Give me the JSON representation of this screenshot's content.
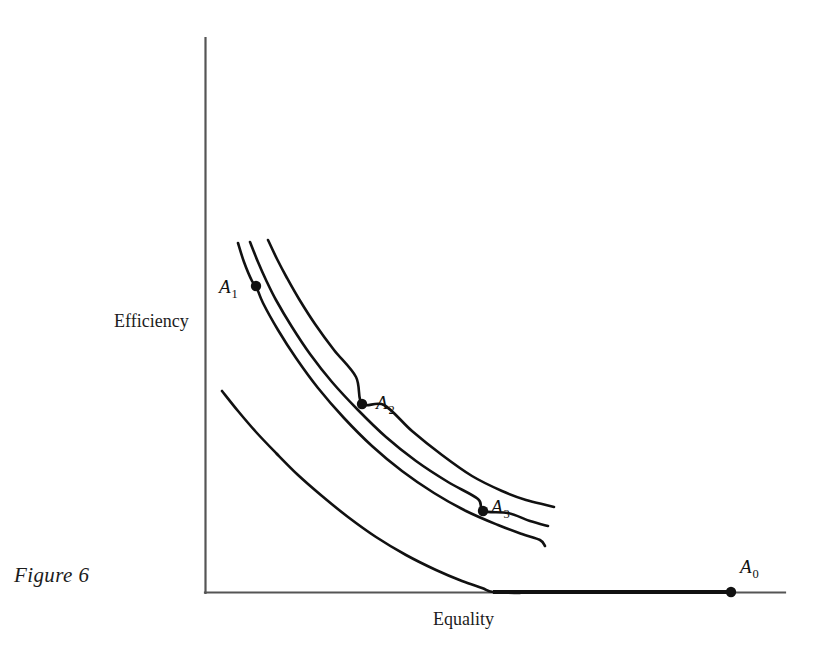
{
  "figure": {
    "caption": "Figure 6",
    "axes": {
      "y_label": "Efficiency",
      "x_label": "Equality"
    },
    "point_labels": {
      "a0": "A",
      "a0_sub": "0",
      "a1": "A",
      "a1_sub": "1",
      "a2": "A",
      "a2_sub": "2",
      "a3": "A",
      "a3_sub": "3"
    },
    "colors": {
      "ink": "#1a1a1a",
      "axis": "#555555",
      "curve": "#111111",
      "background": "#ffffff"
    }
  },
  "chart_data": {
    "type": "line",
    "title": "Figure 6",
    "xlabel": "Equality",
    "ylabel": "Efficiency",
    "grid": false,
    "legend": null,
    "axis_ticks": {
      "x": [],
      "y": []
    },
    "axis_pixel_frame": {
      "origin": [
        205,
        593
      ],
      "y_axis_top": [
        205,
        38
      ],
      "x_axis_right": [
        785,
        593
      ]
    },
    "series": [
      {
        "name": "Indifference curve I1",
        "role": "indifference-curve",
        "points": [
          [
            238,
            243
          ],
          [
            244,
            262
          ],
          [
            252,
            281
          ],
          [
            256,
            286
          ],
          [
            263,
            303
          ],
          [
            278,
            330
          ],
          [
            296,
            358
          ],
          [
            318,
            388
          ],
          [
            344,
            418
          ],
          [
            372,
            446
          ],
          [
            402,
            471
          ],
          [
            434,
            493
          ],
          [
            466,
            511
          ],
          [
            498,
            525
          ],
          [
            522,
            534
          ],
          [
            540,
            540
          ],
          [
            545,
            546
          ]
        ]
      },
      {
        "name": "Indifference curve I2",
        "role": "indifference-curve",
        "points": [
          [
            250,
            242
          ],
          [
            258,
            262
          ],
          [
            266,
            280
          ],
          [
            276,
            300
          ],
          [
            292,
            327
          ],
          [
            310,
            354
          ],
          [
            332,
            382
          ],
          [
            358,
            410
          ],
          [
            386,
            437
          ],
          [
            416,
            461
          ],
          [
            448,
            482
          ],
          [
            478,
            499
          ],
          [
            483,
            511
          ],
          [
            508,
            513
          ],
          [
            530,
            521
          ],
          [
            548,
            526
          ]
        ]
      },
      {
        "name": "Indifference curve I3",
        "role": "indifference-curve",
        "points": [
          [
            268,
            240
          ],
          [
            277,
            259
          ],
          [
            287,
            278
          ],
          [
            299,
            299
          ],
          [
            315,
            324
          ],
          [
            334,
            350
          ],
          [
            356,
            377
          ],
          [
            362,
            404
          ],
          [
            384,
            405
          ],
          [
            412,
            431
          ],
          [
            442,
            455
          ],
          [
            472,
            476
          ],
          [
            502,
            491
          ],
          [
            526,
            500
          ],
          [
            546,
            505
          ],
          [
            554,
            507
          ]
        ]
      },
      {
        "name": "Production possibility frontier",
        "role": "frontier",
        "points": [
          [
            222,
            391
          ],
          [
            238,
            411
          ],
          [
            256,
            432
          ],
          [
            276,
            453
          ],
          [
            298,
            475
          ],
          [
            322,
            496
          ],
          [
            348,
            517
          ],
          [
            376,
            537
          ],
          [
            406,
            555
          ],
          [
            436,
            570
          ],
          [
            462,
            581
          ],
          [
            482,
            588
          ],
          [
            493,
            592
          ],
          [
            520,
            593
          ]
        ]
      },
      {
        "name": "Frontier flat segment along Equality axis",
        "role": "frontier-flat",
        "points": [
          [
            493,
            592
          ],
          [
            600,
            592
          ],
          [
            700,
            592
          ],
          [
            731,
            592
          ]
        ]
      }
    ],
    "points": [
      {
        "label": "A0",
        "on_series": "Frontier flat segment along Equality axis",
        "pixel": [
          731,
          592
        ]
      },
      {
        "label": "A1",
        "on_series": "Indifference curve I1",
        "pixel": [
          256,
          286
        ]
      },
      {
        "label": "A2",
        "on_series": "Indifference curve I3",
        "pixel": [
          362,
          404
        ]
      },
      {
        "label": "A3",
        "on_series": "Indifference curve I2",
        "pixel": [
          483,
          511
        ]
      }
    ],
    "annotations": [
      {
        "text": "Figure 6",
        "pixel": [
          14,
          575
        ],
        "style": "italic-caption"
      },
      {
        "text": "Efficiency",
        "pixel": [
          114,
          320
        ],
        "style": "axis-label"
      },
      {
        "text": "Equality",
        "pixel": [
          433,
          618
        ],
        "style": "axis-label"
      }
    ]
  }
}
